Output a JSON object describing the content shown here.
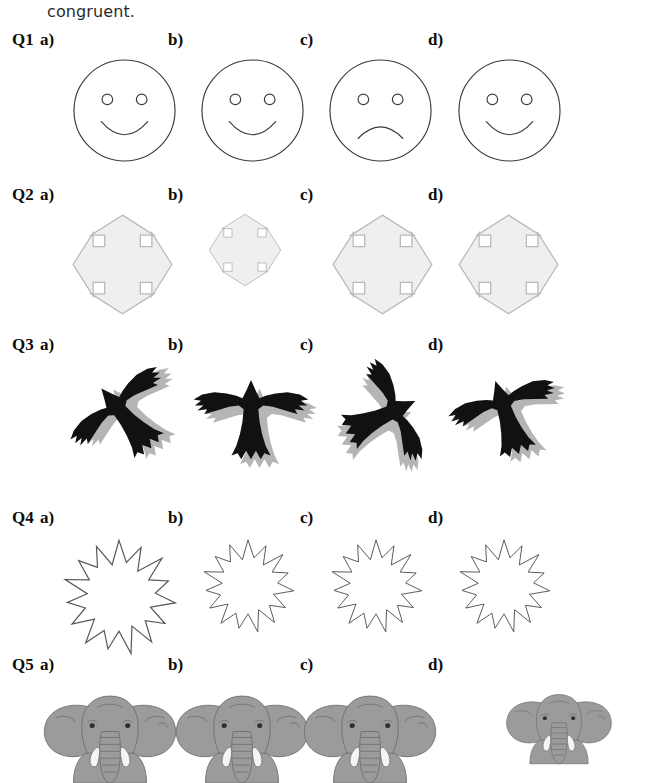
{
  "page": {
    "continued_text": "congruent.",
    "background_color": "#ffffff"
  },
  "option_labels": [
    "a)",
    "b)",
    "c)",
    "d)"
  ],
  "questions": [
    {
      "id": "Q1",
      "label": "Q1",
      "y": 30,
      "figure_type": "smiley-face",
      "shape_label": "face",
      "label_y": 30,
      "figure_y": 58,
      "options": [
        {
          "key": "a",
          "label": "a)",
          "x": 40,
          "fig_x": 72,
          "size": 105,
          "mood": "smile",
          "name": "smiley-face-a"
        },
        {
          "key": "b",
          "label": "b)",
          "x": 168,
          "fig_x": 200,
          "size": 105,
          "mood": "smile",
          "name": "smiley-face-b"
        },
        {
          "key": "c",
          "label": "c)",
          "x": 300,
          "fig_x": 328,
          "size": 105,
          "mood": "frown",
          "name": "frowny-face-c"
        },
        {
          "key": "d",
          "label": "d)",
          "x": 428,
          "fig_x": 457,
          "size": 105,
          "mood": "smile",
          "name": "smiley-face-d"
        }
      ]
    },
    {
      "id": "Q2",
      "label": "Q2",
      "y": 185,
      "figure_type": "four-way-arrow",
      "shape_label": "arrow cross",
      "label_y": 185,
      "figure_y": 212,
      "options": [
        {
          "key": "a",
          "label": "a)",
          "x": 40,
          "fig_x": 70,
          "size": 105,
          "name": "four-way-arrow-a"
        },
        {
          "key": "b",
          "label": "b)",
          "x": 168,
          "fig_x": 207,
          "size": 76,
          "name": "four-way-arrow-b"
        },
        {
          "key": "c",
          "label": "c)",
          "x": 300,
          "fig_x": 330,
          "size": 105,
          "name": "four-way-arrow-c"
        },
        {
          "key": "d",
          "label": "d)",
          "x": 428,
          "fig_x": 456,
          "size": 105,
          "name": "four-way-arrow-d"
        }
      ]
    },
    {
      "id": "Q3",
      "label": "Q3",
      "y": 335,
      "figure_type": "bird-silhouette",
      "shape_label": "bird",
      "label_y": 335,
      "figure_y": 358,
      "options": [
        {
          "key": "a",
          "label": "a)",
          "x": 40,
          "fig_x": 66,
          "size": 120,
          "rotation": -40,
          "name": "bird-silhouette-a"
        },
        {
          "key": "b",
          "label": "b)",
          "x": 168,
          "fig_x": 190,
          "size": 122,
          "rotation": 0,
          "name": "bird-silhouette-b"
        },
        {
          "key": "c",
          "label": "c)",
          "x": 300,
          "fig_x": 322,
          "size": 118,
          "rotation": 65,
          "name": "bird-silhouette-c"
        },
        {
          "key": "d",
          "label": "d)",
          "x": 428,
          "fig_x": 448,
          "size": 118,
          "rotation": -18,
          "name": "bird-silhouette-d"
        }
      ]
    },
    {
      "id": "Q4",
      "label": "Q4",
      "y": 508,
      "figure_type": "starburst",
      "shape_label": "star",
      "label_y": 508,
      "figure_y": 538,
      "options": [
        {
          "key": "a",
          "label": "a)",
          "x": 40,
          "fig_x": 60,
          "size": 118,
          "name": "starburst-a"
        },
        {
          "key": "b",
          "label": "b)",
          "x": 168,
          "fig_x": 200,
          "size": 96,
          "name": "starburst-b"
        },
        {
          "key": "c",
          "label": "c)",
          "x": 300,
          "fig_x": 328,
          "size": 96,
          "name": "starburst-c"
        },
        {
          "key": "d",
          "label": "d)",
          "x": 428,
          "fig_x": 456,
          "size": 96,
          "name": "starburst-d"
        }
      ]
    },
    {
      "id": "Q5",
      "label": "Q5",
      "y": 655,
      "figure_type": "elephant",
      "shape_label": "elephant",
      "label_y": 655,
      "figure_y": 688,
      "options": [
        {
          "key": "a",
          "label": "a)",
          "x": 40,
          "fig_x": 36,
          "size": 148,
          "name": "elephant-a"
        },
        {
          "key": "b",
          "label": "b)",
          "x": 168,
          "fig_x": 168,
          "size": 148,
          "name": "elephant-b"
        },
        {
          "key": "c",
          "label": "c)",
          "x": 300,
          "fig_x": 296,
          "size": 148,
          "name": "elephant-c"
        },
        {
          "key": "d",
          "label": "d)",
          "x": 428,
          "fig_x": 500,
          "size": 118,
          "name": "elephant-d"
        }
      ]
    }
  ],
  "colors": {
    "ink": "#1a1a1a",
    "outline_gray": "#55555a",
    "arrow_fill": "#efeff0",
    "arrow_stroke": "#b9b9bd",
    "bird_black": "#111111",
    "bird_shadow": "#b5b5b5",
    "elephant_gray": "#9b9b9b",
    "elephant_outline": "#6f6f6f",
    "tusk_white": "#f4f4f2"
  }
}
